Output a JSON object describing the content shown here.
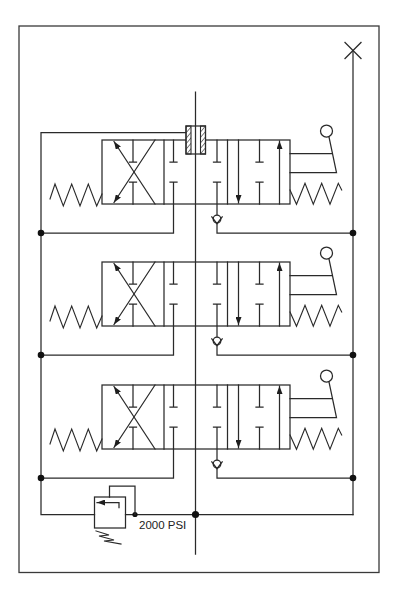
{
  "diagram": {
    "kind": "hydraulic-schematic",
    "labels": {
      "relief_pressure": "2000 PSI"
    },
    "symbols": {
      "directional_control_valves": {
        "count": 3,
        "envelopes_per_valve": 3,
        "left_actuator": "spring",
        "right_actuator": [
          "lever",
          "spring"
        ],
        "envelope_left": "crossed-flow arrows with blocked T ports",
        "envelope_center": "blocked T ports (open center pass-through)",
        "envelope_right": "parallel flow arrows (down / up) with blocked T port"
      },
      "check_valves": {
        "count": 3
      },
      "relief_valve": {
        "count": 1,
        "setting": "2000 PSI"
      },
      "hatched_block": {
        "count": 1,
        "location": "top of valve 1 on center line"
      },
      "junction_dots": 9,
      "plugged_port_x": 1
    },
    "colors": {
      "line": "#2a2a2a",
      "background": "#ffffff"
    }
  }
}
